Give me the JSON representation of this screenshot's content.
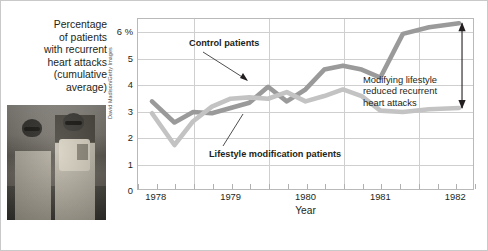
{
  "caption": {
    "lines": [
      "Percentage",
      "of patients",
      "with recurrent",
      "heart attacks",
      "(cumulative",
      "average)"
    ]
  },
  "photo": {
    "alt": "two-anglers-photo",
    "credit": "David Madison/Getty Images"
  },
  "annotations": {
    "control": "Control patients",
    "lifestyle": "Lifestyle modification patients",
    "right_line1": "Modifying lifestyle",
    "right_line2": "reduced recurrent",
    "right_line3": "heart attacks"
  },
  "colors": {
    "control_line": "#9a9a9a",
    "lifestyle_line": "#c3c3c3",
    "grid": "#cfcfcf",
    "frame": "#b9b9b9",
    "text": "#231f20"
  },
  "chart_data": {
    "type": "line",
    "title": "",
    "xlabel": "Year",
    "ylabel": "Percentage of patients with recurrent heart attacks (cumulative average)",
    "xlim": [
      1977.75,
      1982.25
    ],
    "ylim": [
      0,
      6.5
    ],
    "yticks": [
      0,
      1,
      2,
      3,
      4,
      5,
      6
    ],
    "ytick_labels": [
      "0",
      "1",
      "2",
      "3",
      "4",
      "5",
      "6 %"
    ],
    "xticks": [
      1978,
      1979,
      1980,
      1981,
      1982
    ],
    "xtick_labels": [
      "1978",
      "1979",
      "1980",
      "1981",
      "1982"
    ],
    "grid": "both",
    "minor_xticks_per_year": 4,
    "legend": "annotated-inline",
    "series": [
      {
        "name": "Control patients",
        "color": "#9a9a9a",
        "x": [
          1977.95,
          1978.25,
          1978.5,
          1978.75,
          1979.0,
          1979.25,
          1979.5,
          1979.75,
          1980.0,
          1980.25,
          1980.5,
          1980.75,
          1981.0,
          1981.3,
          1981.65,
          1982.05
        ],
        "values": [
          3.35,
          2.55,
          2.95,
          2.9,
          3.1,
          3.3,
          3.9,
          3.35,
          3.8,
          4.55,
          4.7,
          4.55,
          4.25,
          5.9,
          6.15,
          6.3
        ]
      },
      {
        "name": "Lifestyle modification patients",
        "color": "#c3c3c3",
        "x": [
          1977.95,
          1978.25,
          1978.5,
          1978.75,
          1979.0,
          1979.25,
          1979.5,
          1979.75,
          1980.0,
          1980.25,
          1980.5,
          1980.75,
          1981.0,
          1981.3,
          1981.65,
          1982.05
        ],
        "values": [
          2.9,
          1.7,
          2.6,
          3.15,
          3.45,
          3.5,
          3.45,
          3.7,
          3.35,
          3.55,
          3.8,
          3.55,
          3.0,
          2.95,
          3.05,
          3.1
        ]
      }
    ],
    "annotations": [
      {
        "text": "Control patients",
        "target_series": "Control patients"
      },
      {
        "text": "Lifestyle modification patients",
        "target_series": "Lifestyle modification patients"
      },
      {
        "text": "Modifying lifestyle reduced recurrent heart attacks",
        "type": "double-arrow",
        "span_y": [
          3.1,
          6.3
        ],
        "at_x": 1982.05
      }
    ]
  }
}
